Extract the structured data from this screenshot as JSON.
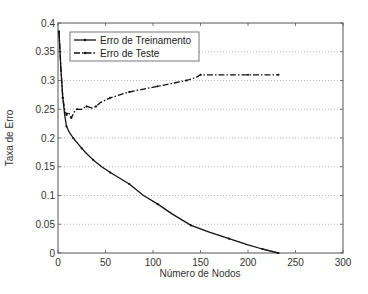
{
  "chart_data": {
    "type": "line",
    "title": "",
    "xlabel": "Número de Nodos",
    "ylabel": "Taxa de Erro",
    "xlim": [
      0,
      300
    ],
    "ylim": [
      0,
      0.4
    ],
    "xticks": [
      0,
      50,
      100,
      150,
      200,
      250,
      300
    ],
    "yticks": [
      0,
      0.05,
      0.1,
      0.15,
      0.2,
      0.25,
      0.3,
      0.35,
      0.4
    ],
    "xtick_labels": [
      "0",
      "50",
      "100",
      "150",
      "200",
      "250",
      "300"
    ],
    "ytick_labels": [
      "0",
      "0.05",
      "0.1",
      "0.15",
      "0.2",
      "0.25",
      "0.3",
      "0.35",
      "0.4"
    ],
    "grid": "horizontal dotted",
    "legend_position": "upper left",
    "series": [
      {
        "name": "Erro de Treinamento",
        "style": "solid",
        "x": [
          1,
          3,
          5,
          7,
          9,
          12,
          16,
          20,
          25,
          30,
          37,
          46,
          55,
          65,
          75,
          90,
          105,
          120,
          140,
          160,
          180,
          200,
          215,
          232
        ],
        "values": [
          0.385,
          0.32,
          0.27,
          0.24,
          0.22,
          0.21,
          0.2,
          0.192,
          0.182,
          0.173,
          0.162,
          0.15,
          0.14,
          0.13,
          0.12,
          0.1,
          0.085,
          0.068,
          0.048,
          0.036,
          0.025,
          0.014,
          0.007,
          0.0
        ]
      },
      {
        "name": "Erro de Teste",
        "style": "dash-dot",
        "x": [
          1,
          3,
          5,
          7,
          9,
          11,
          14,
          17,
          20,
          25,
          30,
          36,
          40,
          45,
          55,
          65,
          75,
          90,
          105,
          120,
          135,
          145,
          150,
          175,
          200,
          232
        ],
        "values": [
          0.385,
          0.32,
          0.27,
          0.25,
          0.24,
          0.245,
          0.235,
          0.245,
          0.25,
          0.25,
          0.255,
          0.252,
          0.255,
          0.262,
          0.27,
          0.275,
          0.28,
          0.285,
          0.29,
          0.295,
          0.3,
          0.305,
          0.31,
          0.31,
          0.31,
          0.31
        ]
      }
    ]
  },
  "legend": {
    "items": [
      {
        "label": "Erro de Treinamento"
      },
      {
        "label": "Erro de Teste"
      }
    ]
  },
  "colors": {
    "line": "#111111",
    "axis": "#555555",
    "grid": "#999999"
  }
}
